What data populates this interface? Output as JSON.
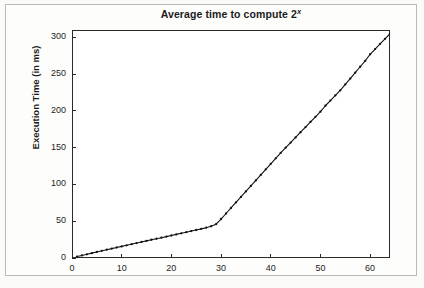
{
  "chart_data": {
    "type": "line",
    "title": "Average time to compute 2",
    "title_superscript": "x",
    "title_full": "Average time to compute 2^x",
    "xlabel": "",
    "ylabel": "Execution Time (in ms)",
    "xlim": [
      0,
      64
    ],
    "ylim": [
      0,
      310
    ],
    "xticks": [
      0,
      10,
      20,
      30,
      40,
      50,
      60
    ],
    "yticks": [
      0,
      50,
      100,
      150,
      200,
      250,
      300
    ],
    "grid": false,
    "legend": false,
    "marker": "plus-dot",
    "line_color": "#111111",
    "series": [
      {
        "name": "average execution time",
        "x": [
          1,
          2,
          3,
          4,
          5,
          6,
          7,
          8,
          9,
          10,
          11,
          12,
          13,
          14,
          15,
          16,
          17,
          18,
          19,
          20,
          21,
          22,
          23,
          24,
          25,
          26,
          27,
          28,
          29,
          30,
          31,
          32,
          33,
          34,
          35,
          36,
          37,
          38,
          39,
          40,
          41,
          42,
          43,
          44,
          45,
          46,
          47,
          48,
          49,
          50,
          51,
          52,
          53,
          54,
          55,
          56,
          57,
          58,
          59,
          60,
          61,
          62,
          63,
          64
        ],
        "values": [
          2,
          3.5,
          5,
          6.6,
          8.2,
          9.8,
          11.3,
          12.8,
          14.3,
          15.8,
          17.3,
          18.8,
          20.3,
          21.8,
          23.3,
          24.8,
          26.2,
          27.6,
          29.1,
          30.6,
          32.1,
          33.6,
          35.1,
          36.6,
          38.1,
          39.6,
          41.2,
          43.2,
          46,
          53,
          60.5,
          68,
          75.5,
          83,
          90.5,
          98,
          105.5,
          113,
          120.5,
          128,
          135.5,
          143,
          150,
          157,
          164,
          171,
          178,
          185,
          192,
          199,
          207,
          214,
          221,
          228,
          236,
          244,
          252,
          260,
          268,
          277,
          284,
          291,
          298,
          305
        ]
      }
    ],
    "annotations": {
      "breakpoint_x": 29,
      "breakpoint_y": 46
    }
  },
  "axis": {
    "y_tick_labels": [
      "0",
      "50",
      "100",
      "150",
      "200",
      "250",
      "300"
    ],
    "x_tick_labels": [
      "0",
      "10",
      "20",
      "30",
      "40",
      "50",
      "60"
    ]
  }
}
